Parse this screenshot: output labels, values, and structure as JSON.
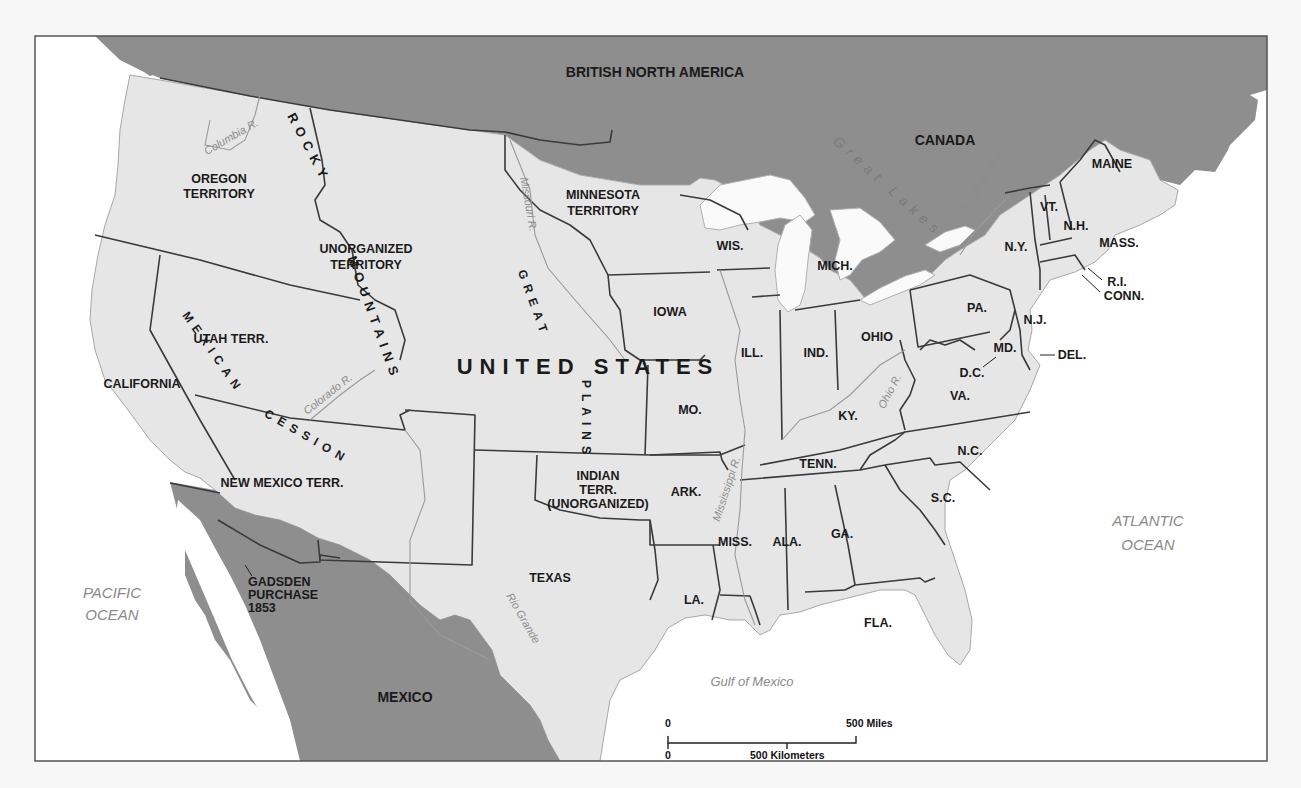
{
  "map": {
    "regions": {
      "british_north_america": "BRITISH NORTH AMERICA",
      "canada": "CANADA",
      "mexico": "MEXICO",
      "united_states": "UNITED STATES"
    },
    "territories": {
      "oregon": [
        "OREGON",
        "TERRITORY"
      ],
      "minnesota": [
        "MINNESOTA",
        "TERRITORY"
      ],
      "unorganized": [
        "UNORGANIZED",
        "TERRITORY"
      ],
      "utah": "UTAH TERR.",
      "california": "CALIFORNIA",
      "new_mexico": "NEW MEXICO TERR.",
      "indian": [
        "INDIAN",
        "TERR.",
        "(UNORGANIZED)"
      ],
      "texas": "TEXAS",
      "gadsden": [
        "GADSDEN",
        "PURCHASE",
        "1853"
      ]
    },
    "states": {
      "wis": "WIS.",
      "mich": "MICH.",
      "iowa": "IOWA",
      "ill": "ILL.",
      "ind": "IND.",
      "ohio": "OHIO",
      "pa": "PA.",
      "ny": "N.Y.",
      "vt": "VT.",
      "nh": "N.H.",
      "maine": "MAINE",
      "mass": "MASS.",
      "ri": "R.I.",
      "conn": "CONN.",
      "nj": "N.J.",
      "del": "DEL.",
      "md": "MD.",
      "dc": "D.C.",
      "va": "VA.",
      "mo": "MO.",
      "ky": "KY.",
      "tenn": "TENN.",
      "nc": "N.C.",
      "ark": "ARK.",
      "sc": "S.C.",
      "miss": "MISS.",
      "ala": "ALA.",
      "ga": "GA.",
      "la": "LA.",
      "fla": "FLA."
    },
    "physical": {
      "rocky": "ROCKY",
      "mountains": "MOUNTAINS",
      "great": "GREAT",
      "plains": "PLAINS",
      "mexican": "MEXICAN",
      "cession": "CESSION",
      "great_lakes": "Great Lakes"
    },
    "rivers": {
      "columbia": "Columbia R.",
      "missouri": "Missouri R.",
      "colorado": "Colorado R.",
      "mississippi": "Mississippi R.",
      "ohio": "Ohio R.",
      "st_lawrence": "St. Lawrence R.",
      "rio_grande": "Rio Grande"
    },
    "water": {
      "pacific": [
        "PACIFIC",
        "OCEAN"
      ],
      "atlantic": [
        "ATLANTIC",
        "OCEAN"
      ],
      "gulf": "Gulf of Mexico"
    },
    "scale": {
      "zero_miles": "0",
      "miles": "500 Miles",
      "zero_km": "0",
      "km": "500 Kilometers"
    },
    "colors": {
      "foreign_land": "#8e8e8e",
      "us_land": "#e6e6e6",
      "water": "#ffffff",
      "border": "#3a3a3a"
    }
  }
}
